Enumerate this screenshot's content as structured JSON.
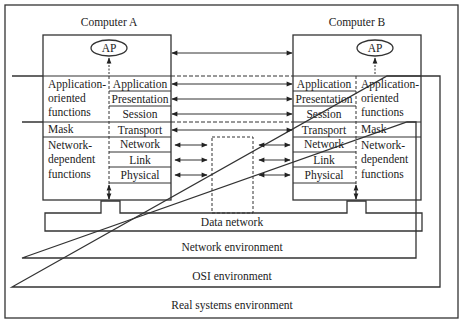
{
  "computer_a": {
    "title": "Computer A",
    "ap_label": "AP",
    "left_labels": {
      "app_oriented": [
        "Application-",
        "oriented",
        "functions"
      ],
      "mask": "Mask",
      "net_dependent": [
        "Network-",
        "dependent",
        "functions"
      ]
    },
    "layers": [
      "Application",
      "Presentation",
      "Session",
      "Transport",
      "Network",
      "Link",
      "Physical"
    ]
  },
  "computer_b": {
    "title": "Computer B",
    "ap_label": "AP",
    "right_labels": {
      "app_oriented": [
        "Application-",
        "oriented",
        "functions"
      ],
      "mask": "Mask",
      "net_dependent": [
        "Network-",
        "dependent",
        "functions"
      ]
    },
    "layers": [
      "Application",
      "Presentation",
      "Session",
      "Transport",
      "Network",
      "Link",
      "Physical"
    ]
  },
  "environments": {
    "data_network": "Data network",
    "network": "Network environment",
    "osi": "OSI environment",
    "real_systems": "Real systems environment"
  }
}
